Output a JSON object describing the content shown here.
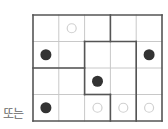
{
  "label": "또는",
  "grid": {
    "rows": 4,
    "cols": 5,
    "cells": [
      [
        "empty",
        "hollow",
        "empty",
        "empty",
        "empty"
      ],
      [
        "filled",
        "empty",
        "empty",
        "empty",
        "filled"
      ],
      [
        "empty",
        "empty",
        "filled",
        "empty",
        "empty"
      ],
      [
        "filled",
        "empty",
        "hollow",
        "hollow",
        "hollow"
      ]
    ]
  },
  "colors": {
    "thin": "#c8c8c8",
    "thick": "#555555",
    "filled": "#333333",
    "hollow": "#d0d0d0"
  }
}
